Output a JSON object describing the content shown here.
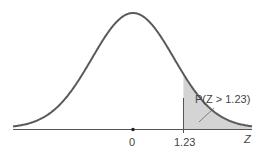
{
  "chart_data": {
    "type": "area",
    "title": "",
    "xlabel": "Z",
    "ylabel": "",
    "tick_labels": [
      "0",
      "1.23"
    ],
    "ticks": [
      0,
      1.23
    ],
    "shaded_region": {
      "from": 1.23,
      "to": "infinity"
    },
    "annotation": "P(Z > 1.23)",
    "xlim": [
      -3.7,
      3.7
    ],
    "grid": false,
    "legend": "none",
    "colors": {
      "curve": "#5a5a5a",
      "shade": "#d4d4d4",
      "axis": "#555555"
    }
  },
  "labels": {
    "zero": "0",
    "z_value": "1.23",
    "axis": "Z",
    "annotation": "P(Z > 1.23)"
  }
}
